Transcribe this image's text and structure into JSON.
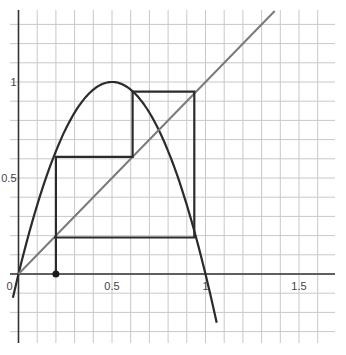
{
  "chart_data": {
    "type": "line",
    "title": "",
    "xlabel": "",
    "ylabel": "",
    "xlim": [
      0,
      1.7
    ],
    "ylim": [
      -0.36,
      1.37
    ],
    "grid": true,
    "grid_step": 0.1,
    "x_ticks": [
      {
        "value": 0,
        "label": "0"
      },
      {
        "value": 0.5,
        "label": "0.5"
      },
      {
        "value": 1,
        "label": "1"
      },
      {
        "value": 1.5,
        "label": "1.5"
      }
    ],
    "y_ticks": [
      {
        "value": 0.5,
        "label": "0.5"
      },
      {
        "value": 1,
        "label": "1"
      }
    ],
    "series": [
      {
        "name": "f(x) = 4x(1-x)",
        "kind": "function",
        "color": "#2b2b2b",
        "x_range": [
          -0.03,
          1.06
        ]
      },
      {
        "name": "y = x",
        "kind": "diagonal",
        "color": "#7a7a7a",
        "x_range": [
          0,
          1.37
        ]
      },
      {
        "name": "cobweb",
        "kind": "polyline",
        "color": "#2b2b2b",
        "points": [
          [
            0.2,
            0
          ],
          [
            0.2,
            0.61
          ],
          [
            0.61,
            0.61
          ],
          [
            0.61,
            0.95
          ],
          [
            0.94,
            0.95
          ],
          [
            0.94,
            0.19
          ],
          [
            0.19,
            0.19
          ],
          [
            0.2,
            0.19
          ]
        ]
      }
    ],
    "annotations": [
      {
        "type": "point",
        "x": 0.2,
        "y": 0,
        "label": "x0"
      }
    ]
  }
}
